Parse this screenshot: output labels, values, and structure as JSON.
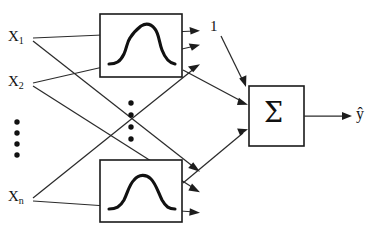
{
  "diagram": {
    "type": "neural-network-architecture",
    "background_color": "#ffffff",
    "line_color": "#2b2b2b",
    "box_stroke_color": "#1a1a1a",
    "curve_color": "#111111",
    "inputs": [
      {
        "id": "x1",
        "label": "X",
        "subscript": "1"
      },
      {
        "id": "x2",
        "label": "X",
        "subscript": "2"
      },
      {
        "id": "xn",
        "label": "X",
        "subscript": "n"
      }
    ],
    "input_ellipsis": "vertical-dots",
    "hidden_units": [
      {
        "id": "rbf-top",
        "glyph": "gaussian-curve"
      },
      {
        "id": "rbf-bottom",
        "glyph": "gaussian-curve"
      }
    ],
    "hidden_ellipsis": "vertical-dots",
    "bias": {
      "label": "1"
    },
    "summation": {
      "label": "Σ"
    },
    "output": {
      "label": "ŷ"
    }
  }
}
